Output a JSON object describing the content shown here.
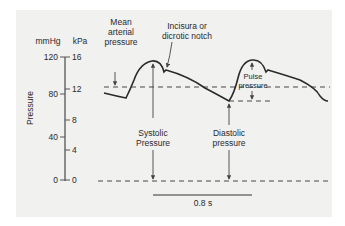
{
  "diagram": {
    "colors": {
      "background": "#f1f1f0",
      "line": "#2a2a2a",
      "axis": "#555555"
    },
    "axis": {
      "label": "Pressure",
      "unit_left": "mmHg",
      "unit_right": "kPa",
      "mmhg_ticks": [
        "120",
        "80",
        "40",
        "0"
      ],
      "kpa_ticks": [
        "16",
        "12",
        "8",
        "4",
        "0"
      ]
    },
    "annotations": {
      "mean_arterial_1": "Mean",
      "mean_arterial_2": "arterial",
      "mean_arterial_3": "pressure",
      "incisura_1": "Incisura or",
      "incisura_2": "dicrotic notch",
      "pulse_1": "Pulse",
      "pulse_2": "pressure",
      "systolic_1": "Systolic",
      "systolic_2": "Pressure",
      "diastolic_1": "Diastolic",
      "diastolic_2": "pressure"
    },
    "scale_bar": {
      "label": "0.8 s"
    }
  }
}
